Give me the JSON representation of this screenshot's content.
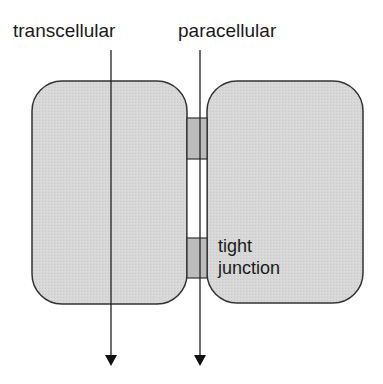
{
  "labels": {
    "transcellular": "transcellular",
    "paracellular": "paracellular",
    "tight_line1": "tight",
    "tight_line2": "junction"
  },
  "colors": {
    "cell_fill": "#d6d6d6",
    "junction_fill": "#bdbdbd",
    "stroke": "#333333",
    "background": "#ffffff"
  }
}
